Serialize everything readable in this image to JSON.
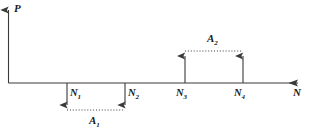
{
  "figure": {
    "background_color": "#ffffff",
    "stroke_color": "#3a3a3a",
    "text_color": "#1a1a1a"
  },
  "axes": {
    "vertical": {
      "label": "P",
      "icon": "arrow-up-icon"
    },
    "horizontal": {
      "label": "N",
      "icon": "arrow-right-icon"
    }
  },
  "ticks": [
    {
      "label": "N",
      "sub": "1"
    },
    {
      "label": "N",
      "sub": "2"
    },
    {
      "label": "N",
      "sub": "3"
    },
    {
      "label": "N",
      "sub": "4"
    }
  ],
  "areas": [
    {
      "label": "A",
      "sub": "1",
      "direction": "below"
    },
    {
      "label": "A",
      "sub": "2",
      "direction": "above"
    }
  ]
}
